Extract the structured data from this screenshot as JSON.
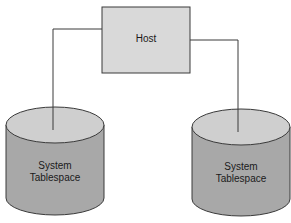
{
  "diagram": {
    "host": {
      "label": "Host"
    },
    "tablespaces": [
      {
        "line1": "System",
        "line2": "Tablespace",
        "position": "left"
      },
      {
        "line1": "System",
        "line2": "Tablespace",
        "position": "right"
      }
    ],
    "colors": {
      "host_fill": "#d9d9d9",
      "cylinder_side": "#a8a8a8",
      "cylinder_top": "#cfcfcf",
      "stroke": "#3a3a3a"
    }
  }
}
